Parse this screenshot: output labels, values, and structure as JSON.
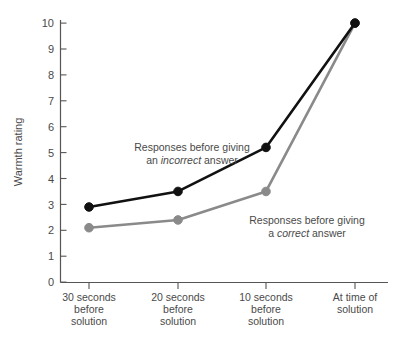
{
  "chart_data": {
    "type": "line",
    "title": "",
    "xlabel": "",
    "ylabel": "Warmth rating",
    "ylim": [
      0,
      10
    ],
    "yticks": [
      "0",
      "1",
      "2",
      "3",
      "4",
      "5",
      "6",
      "7",
      "8",
      "9",
      "10"
    ],
    "grid": false,
    "legend": "inline-annotations",
    "categories": [
      "30 seconds\nbefore\nsolution",
      "20 seconds\nbefore\nsolution",
      "10 seconds\nbefore\nsolution",
      "At time of\nsolution"
    ],
    "category_lines": [
      [
        "30 seconds",
        "before",
        "solution"
      ],
      [
        "20 seconds",
        "before",
        "solution"
      ],
      [
        "10 seconds",
        "before",
        "solution"
      ],
      [
        "At time of",
        "solution"
      ]
    ],
    "series": [
      {
        "name": "Responses before giving an incorrect answer",
        "color": "#111111",
        "values": [
          2.9,
          3.5,
          5.2,
          10.0
        ]
      },
      {
        "name": "Responses before giving a correct answer",
        "color": "#8a8a8a",
        "values": [
          2.1,
          2.4,
          3.5,
          10.0
        ]
      }
    ],
    "annotations": [
      {
        "id": "incorrect-annotation",
        "line1_pre": "Responses before giving",
        "line2_pre": "an ",
        "line2_italic": "incorrect",
        "line2_post": " answer"
      },
      {
        "id": "correct-annotation",
        "line1_pre": "Responses before giving",
        "line2_pre": "a ",
        "line2_italic": "correct",
        "line2_post": " answer"
      }
    ]
  },
  "axes": {
    "y_title": "Warmth rating"
  },
  "caption": {
    "cut_off_line": ""
  }
}
